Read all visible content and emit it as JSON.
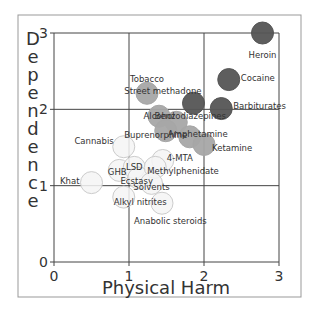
{
  "chart_data": {
    "type": "scatter",
    "title": "",
    "xlabel": "Physical Harm",
    "ylabel": "Dependence",
    "xlim": [
      0,
      3
    ],
    "ylim": [
      0,
      3
    ],
    "xticks": [
      "0",
      "1",
      "2",
      "3"
    ],
    "yticks": [
      "0",
      "1",
      "2",
      "3"
    ],
    "grid": true,
    "legend": null,
    "colors": {
      "dark": "#555555",
      "mid": "#a6a6a6",
      "light": "#f5f5f5",
      "edge": "#cccccc",
      "axis": "#333333",
      "grid": "#444444",
      "frame": "#999999"
    },
    "points": [
      {
        "label": "Heroin",
        "x": 2.78,
        "y": 3.0,
        "shade": "dark"
      },
      {
        "label": "Cocaine",
        "x": 2.33,
        "y": 2.39,
        "shade": "dark"
      },
      {
        "label": "Barbiturates",
        "x": 2.23,
        "y": 2.01,
        "shade": "dark"
      },
      {
        "label": "Street methadone",
        "x": 1.86,
        "y": 2.08,
        "shade": "dark"
      },
      {
        "label": "Tobacco",
        "x": 1.24,
        "y": 2.21,
        "shade": "mid"
      },
      {
        "label": "Alcohol",
        "x": 1.4,
        "y": 1.91,
        "shade": "mid"
      },
      {
        "label": "Benzodiazepines",
        "x": 1.63,
        "y": 1.83,
        "shade": "mid"
      },
      {
        "label": "Buprenorphine",
        "x": 1.49,
        "y": 1.72,
        "shade": "mid"
      },
      {
        "label": "Amphetamine",
        "x": 1.81,
        "y": 1.64,
        "shade": "mid"
      },
      {
        "label": "Ketamine",
        "x": 2.0,
        "y": 1.54,
        "shade": "mid"
      },
      {
        "label": "Cannabis",
        "x": 0.93,
        "y": 1.51,
        "shade": "light"
      },
      {
        "label": "Khat",
        "x": 0.5,
        "y": 1.04,
        "shade": "light"
      },
      {
        "label": "GHB",
        "x": 0.87,
        "y": 1.2,
        "shade": "light"
      },
      {
        "label": "LSD",
        "x": 1.07,
        "y": 1.24,
        "shade": "light"
      },
      {
        "label": "Ecstasy",
        "x": 1.13,
        "y": 1.1,
        "shade": "light"
      },
      {
        "label": "4-MTA",
        "x": 1.45,
        "y": 1.33,
        "shade": "light"
      },
      {
        "label": "Methylphenidate",
        "x": 1.35,
        "y": 1.24,
        "shade": "light"
      },
      {
        "label": "Solvents",
        "x": 1.3,
        "y": 1.03,
        "shade": "light"
      },
      {
        "label": "Alkyl nitrites",
        "x": 0.93,
        "y": 0.85,
        "shade": "light"
      },
      {
        "label": "Anabolic steroids",
        "x": 1.44,
        "y": 0.77,
        "shade": "light"
      }
    ]
  }
}
